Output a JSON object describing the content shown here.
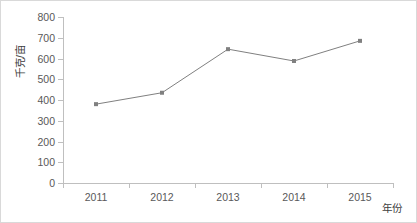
{
  "chart_data": {
    "type": "line",
    "title": "",
    "subtitle": "",
    "xlabel": "年份",
    "ylabel": "千克/亩",
    "categories": [
      "2011",
      "2012",
      "2013",
      "2014",
      "2015"
    ],
    "values": [
      380,
      435,
      645,
      588,
      685
    ],
    "series": [
      {
        "name": "",
        "values": [
          380,
          435,
          645,
          588,
          685
        ]
      }
    ],
    "ylim": [
      0,
      800
    ],
    "yticks": [
      0,
      100,
      200,
      300,
      400,
      500,
      600,
      700,
      800
    ],
    "ytick_labels": [
      "0",
      "100",
      "200",
      "300",
      "400",
      "500",
      "600",
      "700",
      "800"
    ],
    "grid": false,
    "legend": "none",
    "marker": "square",
    "line_color": "#808080",
    "marker_color": "#808080",
    "axis_color": "#bfbfbf",
    "tick_label_color": "#595959",
    "axis_title_color": "#404040",
    "background": "#ffffff",
    "annotations": []
  }
}
